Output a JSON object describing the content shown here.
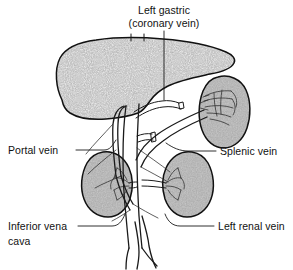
{
  "figure": {
    "background_color": "#ffffff",
    "line_color": "#1a1a1a",
    "liver_fill_color": "#b9b9b9",
    "organ_fill_color": "#a8a8a8"
  },
  "labels": {
    "left_gastric": {
      "line1": "Left gastric",
      "line2": "(coronary vein)"
    },
    "portal_vein": "Portal vein",
    "splenic_vein": "Splenic vein",
    "inferior_vena_cava": {
      "line1": "Inferior vena",
      "line2": "cava"
    },
    "left_renal_vein": "Left renal vein"
  },
  "organs": [
    {
      "name": "liver",
      "fill": "#b9b9b9",
      "texture": "stipple"
    },
    {
      "name": "spleen",
      "fill": "#a8a8a8",
      "texture": "smooth"
    },
    {
      "name": "right-kidney",
      "fill": "#a8a8a8",
      "texture": "smooth"
    },
    {
      "name": "left-kidney",
      "fill": "#a8a8a8",
      "texture": "smooth"
    }
  ],
  "vessels": [
    {
      "name": "inferior-vena-cava"
    },
    {
      "name": "portal-vein"
    },
    {
      "name": "splenic-vein"
    },
    {
      "name": "left-gastric-coronary-vein"
    },
    {
      "name": "left-renal-vein"
    },
    {
      "name": "right-renal-vein"
    },
    {
      "name": "superior-mesenteric-vein"
    },
    {
      "name": "iliac-bifurcation"
    }
  ]
}
